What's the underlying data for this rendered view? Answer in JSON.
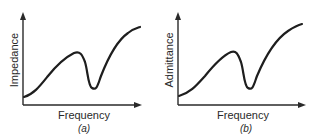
{
  "figure": {
    "panels": [
      {
        "id": "a",
        "ylabel": "Impedance",
        "xlabel": "Frequency",
        "caption": "(a)",
        "curve_shape": "rises to local maximum, sharp dip (minimum), then rises steadily"
      },
      {
        "id": "b",
        "ylabel": "Admittance",
        "xlabel": "Frequency",
        "caption": "(b)",
        "curve_shape": "rises to local maximum, sharp dip (minimum), then rises steadily"
      }
    ],
    "colors": {
      "line": "#1e1e1e",
      "axis": "#2a2a2a",
      "background": "#ffffff"
    }
  }
}
